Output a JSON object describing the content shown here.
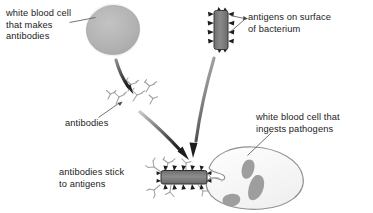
{
  "diagram": {
    "background_color": "#ffffff",
    "text_color": "#1b1b1b",
    "cell_fill": "#b0b0b0",
    "cell_halo": "#f0f0f0",
    "bacterium_fill": "#808080",
    "antigen_color": "#1a1a1a",
    "antibody_color": "#9a9a9a",
    "phagocyte_outline": "#8c8c8c",
    "phagocyte_granule": "#9d9d9d",
    "arrow_color": "#3a3a3a",
    "leader_color": "#555555"
  },
  "labels": {
    "wbc_antibody": "white blood cell\nthat makes\nantibodies",
    "antigens": "antigens on surface\nof bacterium",
    "antibodies": "antibodies",
    "wbc_ingest": "white blood cell that\ningests pathogens",
    "antibodies_stick": "antibodies stick\nto antigens"
  },
  "shapes": {
    "lymphocyte": {
      "cx": 113,
      "cy": 30,
      "rx": 25,
      "ry": 24
    },
    "bacterium_top": {
      "x": 214,
      "y": 11,
      "w": 14,
      "h": 38,
      "spikes_per_side": 4
    },
    "antibody_cluster": {
      "count": 6,
      "origin_x": 103,
      "origin_y": 86
    },
    "bacterium_bottom": {
      "x": 161,
      "y": 171,
      "w": 46,
      "h": 13,
      "spikes_per_side": 5
    },
    "phagocyte": {
      "cx": 247,
      "cy": 180,
      "rx": 58,
      "ry": 32,
      "granules": 3
    }
  },
  "arrows": [
    {
      "name": "lymphocyte-to-antibodies",
      "from": [
        120,
        62
      ],
      "to": [
        139,
        93
      ]
    },
    {
      "name": "antibodies-to-complex",
      "from": [
        146,
        115
      ],
      "to": [
        190,
        163
      ]
    },
    {
      "name": "bacterium-to-complex",
      "from": [
        213,
        56
      ],
      "to": [
        191,
        161
      ]
    }
  ],
  "leaders": [
    {
      "name": "leader-wbc-antibody",
      "from": [
        69,
        23
      ],
      "to": [
        95,
        18
      ]
    },
    {
      "name": "leader-antigen-upper",
      "from": [
        245,
        18
      ],
      "to": [
        229,
        17
      ]
    },
    {
      "name": "leader-antigen-lower",
      "from": [
        245,
        20
      ],
      "to": [
        228,
        33
      ]
    },
    {
      "name": "leader-antibodies",
      "from": [
        98,
        117
      ],
      "to": [
        119,
        103
      ]
    },
    {
      "name": "leader-wbc-ingest",
      "from": [
        270,
        133
      ],
      "to": [
        247,
        155
      ]
    }
  ]
}
